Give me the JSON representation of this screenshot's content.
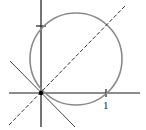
{
  "diagram": {
    "colors": {
      "axis": "#1a1a1a",
      "circle": "#8a8a8a",
      "dashed_line": "#333333",
      "solid_line": "#444444",
      "origin_dot": "#000000"
    },
    "labels": {
      "x_tick": "1"
    },
    "geometry": {
      "origin": [
        41,
        93
      ],
      "unit_px": 65,
      "circle": {
        "cx": 76,
        "cy": 59,
        "r": 46
      },
      "x_axis": {
        "x1": 9,
        "x2": 140
      },
      "y_axis": {
        "y1": 0,
        "y2": 127
      },
      "x_tick_at": 106,
      "y_tick_at": 26,
      "dashed_line": {
        "x1": 9,
        "y1": 125,
        "x2": 125,
        "y2": 6
      },
      "solid_line": {
        "x1": 10,
        "y1": 61,
        "x2": 75,
        "y2": 127
      }
    }
  }
}
